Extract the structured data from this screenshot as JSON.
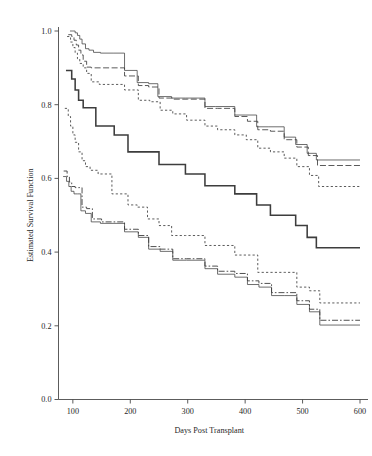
{
  "chart_data": {
    "type": "line",
    "subtype": "kaplan-meier-step",
    "title": "",
    "xlabel": "Days Post Transplant",
    "ylabel": "Estimated Survival Function",
    "xlim": [
      75,
      600
    ],
    "ylim": [
      0.0,
      1.04
    ],
    "xticks": [
      100,
      200,
      300,
      400,
      500,
      600
    ],
    "xtick_labels": [
      "100",
      "200",
      "300",
      "400",
      "500",
      "600"
    ],
    "yticks": [
      0.0,
      0.2,
      0.4,
      0.6,
      0.8,
      1.0
    ],
    "ytick_labels": [
      "0.0",
      "0.2",
      "0.4",
      "0.6",
      "0.8",
      "1.0"
    ],
    "grid": false,
    "legend": "none",
    "frame": "left-bottom-spines",
    "series": [
      {
        "name": "upper-group-solid",
        "style": "solid-thin",
        "dash": "none",
        "width": 0.75,
        "color": "#3d3d3d",
        "x": [
          95,
          100,
          104,
          108,
          112,
          116,
          122,
          128,
          136,
          148,
          170,
          190,
          196,
          212,
          232,
          248,
          272,
          296,
          330,
          348,
          382,
          400,
          420,
          440,
          468,
          488,
          508,
          524,
          560,
          600
        ],
        "y": [
          1.0,
          1.0,
          0.995,
          0.988,
          0.978,
          0.965,
          0.952,
          0.948,
          0.942,
          0.94,
          0.94,
          0.893,
          0.893,
          0.86,
          0.857,
          0.822,
          0.818,
          0.818,
          0.795,
          0.795,
          0.772,
          0.772,
          0.74,
          0.74,
          0.712,
          0.692,
          0.668,
          0.65,
          0.65,
          0.65
        ]
      },
      {
        "name": "upper-group-dashed",
        "style": "dashed",
        "dash": "6,2.5",
        "width": 0.85,
        "color": "#3d3d3d",
        "x": [
          92,
          98,
          102,
          106,
          110,
          114,
          118,
          124,
          132,
          142,
          168,
          190,
          196,
          214,
          232,
          250,
          274,
          300,
          330,
          352,
          382,
          404,
          422,
          444,
          468,
          490,
          510,
          526,
          560,
          600
        ],
        "y": [
          0.99,
          0.985,
          0.975,
          0.962,
          0.948,
          0.935,
          0.918,
          0.902,
          0.9,
          0.9,
          0.9,
          0.878,
          0.878,
          0.852,
          0.848,
          0.818,
          0.815,
          0.815,
          0.79,
          0.79,
          0.768,
          0.755,
          0.732,
          0.728,
          0.705,
          0.685,
          0.662,
          0.635,
          0.635,
          0.635
        ]
      },
      {
        "name": "upper-group-dotted",
        "style": "dotted",
        "dash": "2.2,2.2",
        "width": 0.85,
        "color": "#3d3d3d",
        "x": [
          90,
          96,
          100,
          104,
          108,
          112,
          118,
          124,
          132,
          146,
          170,
          190,
          196,
          214,
          234,
          252,
          274,
          298,
          330,
          352,
          382,
          402,
          422,
          444,
          468,
          490,
          512,
          528,
          560,
          600
        ],
        "y": [
          0.985,
          0.97,
          0.955,
          0.94,
          0.925,
          0.912,
          0.9,
          0.885,
          0.862,
          0.855,
          0.855,
          0.84,
          0.84,
          0.812,
          0.808,
          0.785,
          0.775,
          0.758,
          0.742,
          0.732,
          0.718,
          0.705,
          0.682,
          0.672,
          0.655,
          0.632,
          0.608,
          0.578,
          0.578,
          0.578
        ]
      },
      {
        "name": "center-solid-bold",
        "style": "solid-bold",
        "dash": "none",
        "width": 1.55,
        "color": "#3d3d3d",
        "x": [
          88,
          94,
          98,
          104,
          110,
          118,
          126,
          140,
          162,
          172,
          190,
          196,
          212,
          230,
          250,
          272,
          296,
          330,
          352,
          382,
          400,
          420,
          444,
          468,
          488,
          508,
          524,
          560,
          600
        ],
        "y": [
          0.893,
          0.893,
          0.87,
          0.84,
          0.812,
          0.792,
          0.792,
          0.742,
          0.742,
          0.718,
          0.718,
          0.672,
          0.672,
          0.672,
          0.638,
          0.638,
          0.612,
          0.58,
          0.58,
          0.558,
          0.558,
          0.528,
          0.5,
          0.5,
          0.472,
          0.44,
          0.412,
          0.412,
          0.412
        ]
      },
      {
        "name": "lower-group-dotted",
        "style": "dotted",
        "dash": "2.2,2.2",
        "width": 0.85,
        "color": "#3d3d3d",
        "x": [
          86,
          92,
          96,
          100,
          104,
          110,
          116,
          122,
          130,
          144,
          168,
          190,
          196,
          212,
          230,
          250,
          272,
          296,
          330,
          352,
          382,
          402,
          422,
          444,
          468,
          490,
          512,
          530,
          560,
          600
        ],
        "y": [
          0.79,
          0.768,
          0.742,
          0.718,
          0.698,
          0.672,
          0.648,
          0.632,
          0.622,
          0.612,
          0.558,
          0.558,
          0.528,
          0.522,
          0.49,
          0.472,
          0.445,
          0.445,
          0.418,
          0.418,
          0.392,
          0.392,
          0.345,
          0.345,
          0.345,
          0.305,
          0.295,
          0.262,
          0.262,
          0.262
        ]
      },
      {
        "name": "lower-group-dashdot",
        "style": "dash-dot",
        "dash": "6,2,1.6,2",
        "width": 0.9,
        "color": "#3d3d3d",
        "x": [
          84,
          90,
          94,
          98,
          104,
          110,
          116,
          124,
          134,
          150,
          170,
          190,
          196,
          214,
          232,
          252,
          274,
          298,
          330,
          352,
          382,
          404,
          424,
          446,
          468,
          490,
          512,
          530,
          560,
          600
        ],
        "y": [
          0.62,
          0.605,
          0.59,
          0.578,
          0.575,
          0.575,
          0.522,
          0.518,
          0.49,
          0.482,
          0.482,
          0.462,
          0.462,
          0.445,
          0.415,
          0.408,
          0.382,
          0.382,
          0.362,
          0.348,
          0.342,
          0.322,
          0.315,
          0.29,
          0.29,
          0.268,
          0.245,
          0.215,
          0.215,
          0.215
        ]
      },
      {
        "name": "lower-group-solid",
        "style": "solid-thin",
        "dash": "none",
        "width": 0.75,
        "color": "#3d3d3d",
        "x": [
          83,
          89,
          93,
          97,
          102,
          108,
          114,
          122,
          132,
          148,
          170,
          190,
          196,
          214,
          232,
          252,
          274,
          298,
          330,
          352,
          382,
          404,
          424,
          446,
          468,
          490,
          512,
          530,
          560,
          600
        ],
        "y": [
          0.605,
          0.592,
          0.578,
          0.565,
          0.558,
          0.558,
          0.512,
          0.505,
          0.482,
          0.478,
          0.478,
          0.455,
          0.455,
          0.44,
          0.408,
          0.402,
          0.378,
          0.378,
          0.355,
          0.34,
          0.332,
          0.312,
          0.305,
          0.282,
          0.282,
          0.258,
          0.238,
          0.202,
          0.202,
          0.202
        ]
      }
    ]
  }
}
